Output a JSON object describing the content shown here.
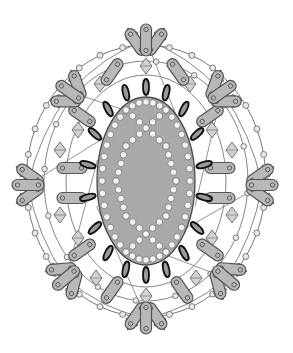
{
  "diagram": {
    "type": "beading-pattern",
    "center": [
      146,
      181
    ],
    "colors": {
      "background": "#ffffff",
      "oval_fill": "#a9a9a9",
      "oval_stroke": "#4a4a4a",
      "bugle_fill": "#b8b8b8",
      "bugle_stroke": "#555555",
      "bicone_fill": "#d2d2d2",
      "bicone_stroke": "#6a6a6a",
      "seed_fill": "#e8e8e8",
      "seed_stroke": "#6e6e6e",
      "thread": "#777777",
      "drop_fill": "#9a9a9a",
      "drop_stroke": "#111111",
      "pearl_fill": "#f2f2f2",
      "pearl_stroke": "#777777"
    },
    "cabochon": {
      "cx": 146,
      "cy": 181,
      "rx": 49,
      "ry": 84
    },
    "inner_drops": {
      "count": 18,
      "rx": 59,
      "ry": 94,
      "len": 12
    },
    "outer_clusters": [
      {
        "x": 146,
        "y": 40,
        "a": 0
      },
      {
        "x": 222,
        "y": 92,
        "a": 55
      },
      {
        "x": 262,
        "y": 185,
        "a": 90
      },
      {
        "x": 226,
        "y": 278,
        "a": 130
      },
      {
        "x": 146,
        "y": 318,
        "a": 180
      },
      {
        "x": 66,
        "y": 278,
        "a": 230
      },
      {
        "x": 28,
        "y": 185,
        "a": 270
      },
      {
        "x": 70,
        "y": 92,
        "a": 305
      }
    ],
    "mid_bugles": [
      {
        "x": 112,
        "y": 72,
        "a": 35
      },
      {
        "x": 178,
        "y": 72,
        "a": -35
      },
      {
        "x": 210,
        "y": 116,
        "a": 55
      },
      {
        "x": 220,
        "y": 168,
        "a": 90
      },
      {
        "x": 220,
        "y": 198,
        "a": 90
      },
      {
        "x": 210,
        "y": 250,
        "a": 125
      },
      {
        "x": 182,
        "y": 290,
        "a": 145
      },
      {
        "x": 112,
        "y": 290,
        "a": -145
      },
      {
        "x": 82,
        "y": 250,
        "a": -125
      },
      {
        "x": 72,
        "y": 198,
        "a": -90
      },
      {
        "x": 72,
        "y": 168,
        "a": -90
      },
      {
        "x": 82,
        "y": 116,
        "a": -55
      }
    ],
    "mid_bicones": [
      {
        "x": 146,
        "y": 66
      },
      {
        "x": 190,
        "y": 84
      },
      {
        "x": 232,
        "y": 150
      },
      {
        "x": 232,
        "y": 215
      },
      {
        "x": 196,
        "y": 278
      },
      {
        "x": 146,
        "y": 296
      },
      {
        "x": 96,
        "y": 278
      },
      {
        "x": 60,
        "y": 215
      },
      {
        "x": 60,
        "y": 150
      },
      {
        "x": 100,
        "y": 84
      },
      {
        "x": 78,
        "y": 130
      },
      {
        "x": 212,
        "y": 130
      },
      {
        "x": 78,
        "y": 238
      },
      {
        "x": 212,
        "y": 238
      }
    ],
    "outer_ring": {
      "rx": 120,
      "ry": 136,
      "seeds": 32
    }
  }
}
